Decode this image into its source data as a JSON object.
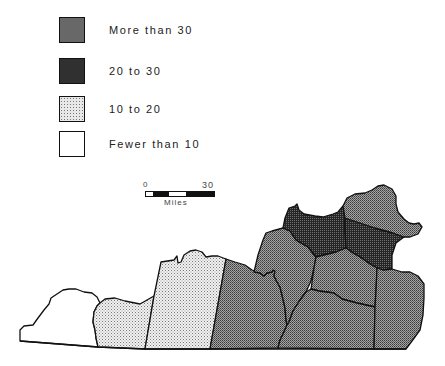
{
  "legend": {
    "items": [
      {
        "label": "More than 30",
        "class": "dark"
      },
      {
        "label": "20 to 30",
        "class": "mid"
      },
      {
        "label": "10 to 20",
        "class": "light"
      },
      {
        "label": "Fewer than 10",
        "class": "none"
      }
    ]
  },
  "scale": {
    "start": "0",
    "end": "30",
    "unit": "Miles"
  },
  "map": {
    "regions": [
      {
        "name": "county-west-1",
        "category": "Fewer than 10"
      },
      {
        "name": "county-west-2",
        "category": "10 to 20"
      },
      {
        "name": "county-west-3",
        "category": "10 to 20"
      },
      {
        "name": "county-central-1",
        "category": "20 to 30"
      },
      {
        "name": "county-central-2",
        "category": "20 to 30"
      },
      {
        "name": "county-north-1",
        "category": "More than 30"
      },
      {
        "name": "county-north-2",
        "category": "More than 30"
      },
      {
        "name": "county-northeast",
        "category": "20 to 30"
      },
      {
        "name": "county-central-3",
        "category": "20 to 30"
      },
      {
        "name": "county-south-1",
        "category": "20 to 30"
      },
      {
        "name": "county-east",
        "category": "20 to 30"
      }
    ],
    "colors": {
      "dark": "#2b2b2b",
      "mid": "#8c8c8c",
      "light": "#e8e8e8",
      "none": "#ffffff",
      "stroke": "#111111"
    }
  }
}
